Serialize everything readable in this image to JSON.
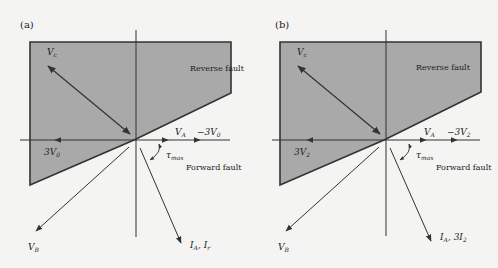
{
  "colors": {
    "background": "#f4f4f2",
    "region_fill": "#a9a9a9",
    "line": "#333333"
  },
  "panels": [
    {
      "id": "a",
      "label": "(a)",
      "reverse_fault_label": "Reverse fault",
      "forward_fault_label": "Forward fault",
      "vc_label": "V",
      "vc_sub": "c",
      "vb_label": "V",
      "vb_sub": "B",
      "va_label": "V",
      "va_sub": "A",
      "neg_seq_label": "−3V",
      "neg_seq_sub": "0",
      "pos_seq_label": "3V",
      "pos_seq_sub": "0",
      "tau_label": "τ",
      "tau_sub": "max",
      "current_label": "I",
      "current_sub": "A",
      "current_label2": ", I",
      "current_sub2": "r"
    },
    {
      "id": "b",
      "label": "(b)",
      "reverse_fault_label": "Reverse fault",
      "forward_fault_label": "Forward fault",
      "vc_label": "V",
      "vc_sub": "c",
      "vb_label": "V",
      "vb_sub": "B",
      "va_label": "V",
      "va_sub": "A",
      "neg_seq_label": "−3V",
      "neg_seq_sub": "2",
      "pos_seq_label": "3V",
      "pos_seq_sub": "2",
      "tau_label": "τ",
      "tau_sub": "max",
      "current_label": "I",
      "current_sub": "A",
      "current_label2": ", 3I",
      "current_sub2": "2"
    }
  ]
}
